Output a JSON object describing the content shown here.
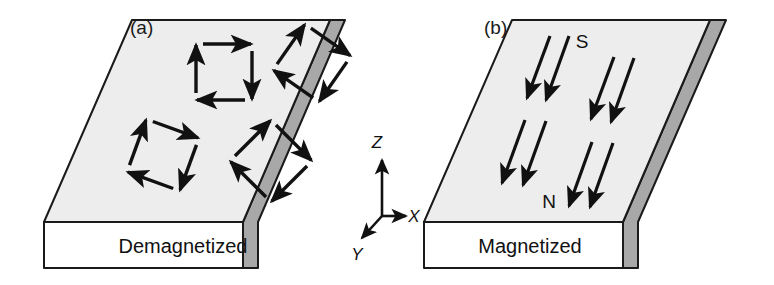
{
  "figure": {
    "width": 774,
    "height": 285,
    "background": "#ffffff"
  },
  "colors": {
    "top_face": "#ededed",
    "front_face": "#ffffff",
    "side_face": "#a8a8a8",
    "outline": "#1a1a1a",
    "arrow": "#111111",
    "text": "#111111"
  },
  "panels": [
    {
      "id": "a",
      "label": "(a)",
      "label_x": 130,
      "label_y": 34,
      "front_label": "Demagnetized",
      "front_label_x": 183,
      "front_label_y": 253,
      "state": "demagnetized",
      "domain_count": 4,
      "slab": {
        "top": [
          [
            44,
            222
          ],
          [
            132,
            20
          ],
          [
            330,
            20
          ],
          [
            243,
            222
          ]
        ],
        "front": [
          [
            44,
            222
          ],
          [
            243,
            222
          ],
          [
            243,
            268
          ],
          [
            44,
            268
          ]
        ],
        "side": [
          [
            243,
            222
          ],
          [
            330,
            20
          ],
          [
            345,
            20
          ],
          [
            258,
            222
          ],
          [
            258,
            268
          ],
          [
            243,
            268
          ]
        ]
      },
      "vortex_loops": [
        {
          "name": "vortex-loop-1",
          "cx": 224,
          "cy": 72,
          "size": 56,
          "rotation": 0,
          "sense": "clockwise"
        },
        {
          "name": "vortex-loop-2",
          "cx": 312,
          "cy": 63,
          "size": 56,
          "rotation": 35,
          "sense": "clockwise"
        },
        {
          "name": "vortex-loop-3",
          "cx": 163,
          "cy": 155,
          "size": 56,
          "rotation": 20,
          "sense": "clockwise"
        },
        {
          "name": "vortex-loop-4",
          "cx": 271,
          "cy": 161,
          "size": 58,
          "rotation": 45,
          "sense": "clockwise"
        }
      ]
    },
    {
      "id": "b",
      "label": "(b)",
      "label_x": 484,
      "label_y": 34,
      "front_label": "Magnetized",
      "front_label_x": 530,
      "front_label_y": 253,
      "state": "magnetized",
      "arrow_count": 8,
      "slab": {
        "top": [
          [
            424,
            222
          ],
          [
            512,
            20
          ],
          [
            710,
            20
          ],
          [
            623,
            222
          ]
        ],
        "front": [
          [
            424,
            222
          ],
          [
            623,
            222
          ],
          [
            623,
            268
          ],
          [
            424,
            268
          ]
        ],
        "side": [
          [
            623,
            222
          ],
          [
            710,
            20
          ],
          [
            726,
            20
          ],
          [
            638,
            222
          ],
          [
            638,
            268
          ],
          [
            623,
            268
          ]
        ]
      },
      "magnetization_arrows": [
        {
          "name": "magnetization-arrow-1",
          "x1": 550,
          "y1": 36,
          "x2": 527,
          "y2": 98
        },
        {
          "name": "magnetization-arrow-2",
          "x1": 569,
          "y1": 36,
          "x2": 546,
          "y2": 100
        },
        {
          "name": "magnetization-arrow-3",
          "x1": 614,
          "y1": 57,
          "x2": 591,
          "y2": 119
        },
        {
          "name": "magnetization-arrow-4",
          "x1": 634,
          "y1": 58,
          "x2": 611,
          "y2": 122
        },
        {
          "name": "magnetization-arrow-5",
          "x1": 525,
          "y1": 120,
          "x2": 502,
          "y2": 183
        },
        {
          "name": "magnetization-arrow-6",
          "x1": 546,
          "y1": 121,
          "x2": 523,
          "y2": 185
        },
        {
          "name": "magnetization-arrow-7",
          "x1": 592,
          "y1": 142,
          "x2": 569,
          "y2": 206
        },
        {
          "name": "magnetization-arrow-8",
          "x1": 613,
          "y1": 143,
          "x2": 590,
          "y2": 207
        }
      ],
      "pole_labels": [
        {
          "name": "pole-label-south",
          "text": "S",
          "x": 582,
          "y": 48
        },
        {
          "name": "pole-label-north",
          "text": "N",
          "x": 549,
          "y": 208
        }
      ]
    }
  ],
  "axes": {
    "origin_x": 382,
    "origin_y": 216,
    "items": [
      {
        "name": "axis-z",
        "label": "Z",
        "label_x": 377,
        "label_y": 148,
        "tip_x": 382,
        "tip_y": 160
      },
      {
        "name": "axis-x",
        "label": "X",
        "label_x": 414,
        "label_y": 222,
        "tip_x": 406,
        "tip_y": 216
      },
      {
        "name": "axis-y",
        "label": "Y",
        "label_x": 357,
        "label_y": 260,
        "tip_x": 362,
        "tip_y": 238
      }
    ]
  }
}
